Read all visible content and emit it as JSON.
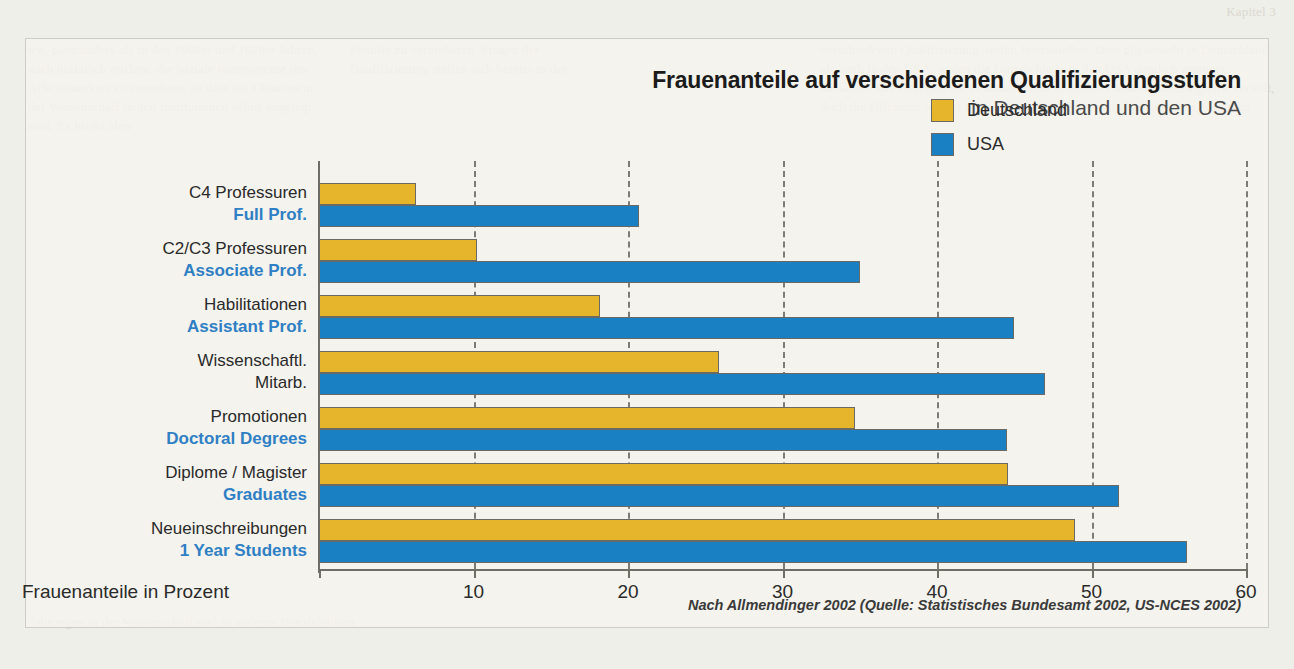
{
  "page": {
    "background_color": "#efefe9",
    "panel_color": "#f5f4ee",
    "bg_text_top_right": "Kapitel 3",
    "bg_text_left": "ten, ganz anders als in den 1960er und 1970er Jahren, auch praktisch reichen, die soziale Komponente des Arbeitsmarktes zu verankern, so dass die Chancen in der Wissenschaft in den Institutionen selbst angelegt sind. Es bleibt aber",
    "bg_text_mid": "Familie zu vereinbaren. Fragen der Qualifizierung stellen sich bereits in der",
    "bg_text_right": "verschiedenen Qualifizierungsstufen festzustellen. Dies gilt sowohl in Deutschland als auch in den USA, wobei die Unterschiede in den USA deutlich geringer ausfallen. Die Gruppen der Graduates sind in beiden Ländern nahezu gleich verteilt, doch die Differenz wächst mit jeder weiteren Stufe der akademischen Laufbahn.",
    "bg_text_bottom": "fahrungen in der Wissenschaft und in anderen Berufsfeldern."
  },
  "chart_data": {
    "type": "bar",
    "orientation": "horizontal",
    "title": "Frauenanteile auf verschiedenen Qualifizierungsstufen",
    "subtitle": "in Deutschland und den USA",
    "xlabel": "Frauenanteile in Prozent",
    "ylabel": "",
    "xlim": [
      0,
      60
    ],
    "xticks": [
      0,
      10,
      20,
      30,
      40,
      50,
      60
    ],
    "xtick_labels": [
      "",
      "10",
      "20",
      "30",
      "40",
      "50",
      "60"
    ],
    "grid": "vertical-dashed",
    "legend_position": "top-right",
    "legend": [
      "Deutschland",
      "USA"
    ],
    "colors": {
      "Deutschland": "#e7b52c",
      "USA": "#1a80c4"
    },
    "categories": [
      {
        "de": "C4 Professuren",
        "us": "Full Prof."
      },
      {
        "de": "C2/C3 Professuren",
        "us": "Associate Prof."
      },
      {
        "de": "Habilitationen",
        "us": "Assistant Prof."
      },
      {
        "de": "Wissenschaftl.",
        "us": "Mitarb.",
        "us_is_german": true
      },
      {
        "de": "Promotionen",
        "us": "Doctoral Degrees"
      },
      {
        "de": "Diplome / Magister",
        "us": "Graduates"
      },
      {
        "de": "Neueinschreibungen",
        "us": "1 Year Students"
      }
    ],
    "series": [
      {
        "name": "Deutschland",
        "values": [
          6.3,
          10.2,
          18.2,
          25.9,
          34.7,
          44.6,
          48.9
        ]
      },
      {
        "name": "USA",
        "values": [
          20.7,
          35.0,
          45.0,
          47.0,
          44.5,
          51.8,
          56.2
        ]
      }
    ],
    "source": "Nach Allmendinger 2002 (Quelle: Statistisches Bundesamt 2002, US-NCES 2002)"
  }
}
